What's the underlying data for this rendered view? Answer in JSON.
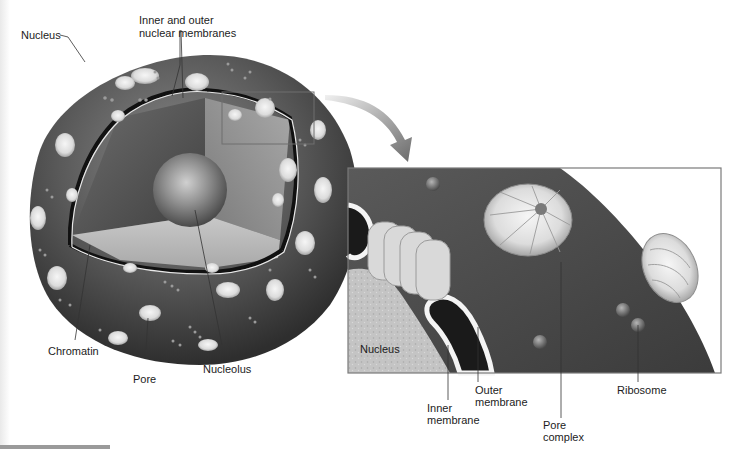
{
  "figure": {
    "left_panel": {
      "labels": {
        "nucleus": "Nucleus",
        "membranes_line1": "Inner and outer",
        "membranes_line2": "nuclear membranes",
        "chromatin": "Chromatin",
        "pore": "Pore",
        "nucleolus": "Nucleolus"
      }
    },
    "inset_panel": {
      "labels": {
        "nucleus": "Nucleus",
        "inner_membrane_line1": "Inner",
        "inner_membrane_line2": "membrane",
        "outer_membrane_line1": "Outer",
        "outer_membrane_line2": "membrane",
        "pore_complex_line1": "Pore",
        "pore_complex_line2": "complex",
        "ribosome": "Ribosome"
      }
    },
    "colors": {
      "cytoplasm_dark": "#4a4a4a",
      "nucleus_surface": "#5e5e5e",
      "nucleoplasm": "#bdbdbd",
      "pore": "#e3e3e3",
      "membrane_line": "#111111",
      "inset_border": "#7a7a7a",
      "arrow": "#8a8a8a"
    }
  }
}
